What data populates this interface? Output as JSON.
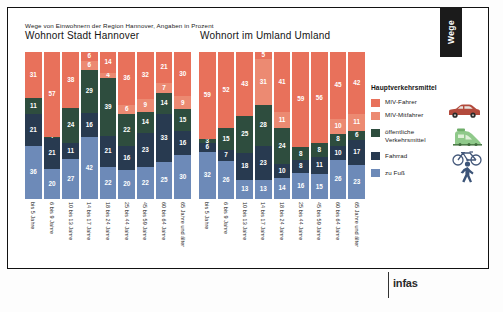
{
  "header": {
    "tab_label": "Wege",
    "subtitle": "Wege von Einwohnern der Region Hannover, Angaben in Prozent"
  },
  "footer": {
    "logo": "infas"
  },
  "legend": {
    "title": "Hauptverkehrsmittel",
    "items": [
      {
        "label": "MIV-Fahrer",
        "color": "#e8715b",
        "icon": "car-icon"
      },
      {
        "label": "MIV-Mitfahrer",
        "color": "#ec8a72",
        "icon": "car-icon"
      },
      {
        "label": "öffentliche Verkehrsmittel",
        "color": "#2e4d3e",
        "icon": "train-icon"
      },
      {
        "label": "Fahrrad",
        "color": "#283a50",
        "icon": "bicycle-icon"
      },
      {
        "label": "zu Fuß",
        "color": "#6d8ab8",
        "icon": "pedestrian-icon"
      }
    ]
  },
  "chart_data": [
    {
      "type": "bar",
      "title": "Wohnort Stadt Hannover",
      "subtitle": "Wege von Einwohnern der Region Hannover, Angaben in Prozent",
      "xlabel": "",
      "ylabel": "Prozent",
      "ylim": [
        0,
        100
      ],
      "stacked": true,
      "grid": false,
      "legend_position": "right",
      "categories": [
        "bis 5 Jahre",
        "6 bis 9 Jahre",
        "10 bis 13 Jahre",
        "14 bis 17 Jahre",
        "18 bis 24 Jahre",
        "25 bis 44 Jahre",
        "45 bis 59 Jahre",
        "60 bis 64 Jahre",
        "65 Jahre und älter"
      ],
      "series": [
        {
          "name": "zu Fuß",
          "color": "#6d8ab8",
          "values": [
            36,
            20,
            27,
            22,
            20,
            22,
            20,
            22,
            25,
            30
          ]
        },
        {
          "name": "Fahrrad",
          "color": "#283a50",
          "values": [
            21,
            21,
            11,
            16,
            21,
            16,
            23,
            33,
            16
          ]
        },
        {
          "name": "öffentliche Verkehrsmittel",
          "color": "#2e4d3e",
          "values": [
            11,
            1,
            24,
            39,
            22,
            6,
            14,
            15,
            15
          ]
        },
        {
          "name": "MIV-Mitfahrer",
          "color": "#ec8a72",
          "values": [
            0,
            0,
            0,
            4,
            6,
            9,
            9,
            7,
            9
          ]
        },
        {
          "name": "MIV-Fahrer",
          "color": "#e8715b",
          "values": [
            31,
            57,
            38,
            14,
            36,
            36,
            32,
            21,
            30
          ]
        }
      ]
    },
    {
      "type": "bar",
      "title": "Wohnort im Umland Umland",
      "subtitle": "Wege von Einwohnern der Region Hannover, Angaben in Prozent",
      "xlabel": "",
      "ylabel": "Prozent",
      "ylim": [
        0,
        100
      ],
      "stacked": true,
      "grid": false,
      "legend_position": "right",
      "categories": [
        "bis 5 Jahre",
        "6 bis 9 Jahre",
        "10 bis 13 Jahre",
        "14 bis 17 Jahre",
        "18 bis 24 Jahre",
        "25 bis 44 Jahre",
        "45 bis 59 Jahre",
        "60 bis 64 Jahre",
        "65 Jahre und älter"
      ],
      "series": [
        {
          "name": "zu Fuß",
          "color": "#6d8ab8",
          "values": [
            32,
            26,
            13,
            13,
            14,
            16,
            16,
            15,
            26,
            23
          ]
        },
        {
          "name": "Fahrrad",
          "color": "#283a50",
          "values": [
            6,
            7,
            18,
            23,
            10,
            8,
            8,
            10,
            10,
            17
          ]
        },
        {
          "name": "öffentliche Verkehrsmittel",
          "color": "#2e4d3e",
          "values": [
            3,
            15,
            25,
            28,
            24,
            8,
            8,
            8,
            8,
            6
          ]
        },
        {
          "name": "MIV-Mitfahrer",
          "color": "#ec8a72",
          "values": [
            0,
            0,
            0,
            5,
            11,
            11,
            0,
            0,
            10,
            11
          ]
        },
        {
          "name": "MIV-Fahrer",
          "color": "#e8715b",
          "values": [
            59,
            52,
            43,
            31,
            41,
            59,
            56,
            45,
            42
          ]
        }
      ]
    }
  ],
  "charts": [
    {
      "id": "left",
      "title": "Wohnort Stadt Hannover",
      "bars": [
        {
          "category": "bis 5 Jahre",
          "segments": [
            {
              "key": "MIV-Fahrer",
              "value": "31"
            },
            {
              "key": "öffentliche Verkehrsmittel",
              "value": "11"
            },
            {
              "key": "Fahrrad",
              "value": "21"
            },
            {
              "key": "zu Fuß",
              "value": "36"
            }
          ]
        },
        {
          "category": "6 bis 9 Jahre",
          "segments": [
            {
              "key": "MIV-Fahrer",
              "value": "57"
            },
            {
              "key": "öffentliche Verkehrsmittel",
              "value": "1"
            },
            {
              "key": "Fahrrad",
              "value": "21"
            },
            {
              "key": "zu Fuß",
              "value": "20"
            }
          ]
        },
        {
          "category": "10 bis 13 Jahre",
          "segments": [
            {
              "key": "MIV-Fahrer",
              "value": "38"
            },
            {
              "key": "öffentliche Verkehrsmittel",
              "value": "24"
            },
            {
              "key": "Fahrrad",
              "value": "11"
            },
            {
              "key": "zu Fuß",
              "value": "27"
            }
          ]
        },
        {
          "category": "14 bis 17 Jahre",
          "segments": [
            {
              "key": "MIV-Fahrer",
              "value": "6"
            },
            {
              "key": "MIV-Mitfahrer",
              "value": "6"
            },
            {
              "key": "öffentliche Verkehrsmittel",
              "value": "29"
            },
            {
              "key": "Fahrrad",
              "value": "16"
            },
            {
              "key": "zu Fuß",
              "value": "42"
            }
          ]
        },
        {
          "category": "18 bis 24 Jahre",
          "segments": [
            {
              "key": "MIV-Fahrer",
              "value": "14"
            },
            {
              "key": "MIV-Mitfahrer",
              "value": "4"
            },
            {
              "key": "öffentliche Verkehrsmittel",
              "value": "39"
            },
            {
              "key": "Fahrrad",
              "value": "21"
            },
            {
              "key": "zu Fuß",
              "value": "22"
            }
          ]
        },
        {
          "category": "25 bis 44 Jahre",
          "segments": [
            {
              "key": "MIV-Fahrer",
              "value": "36"
            },
            {
              "key": "MIV-Mitfahrer",
              "value": "6"
            },
            {
              "key": "öffentliche Verkehrsmittel",
              "value": "22"
            },
            {
              "key": "Fahrrad",
              "value": "16"
            },
            {
              "key": "zu Fuß",
              "value": "20"
            }
          ]
        },
        {
          "category": "45 bis 59 Jahre",
          "segments": [
            {
              "key": "MIV-Fahrer",
              "value": "32"
            },
            {
              "key": "MIV-Mitfahrer",
              "value": "9"
            },
            {
              "key": "öffentliche Verkehrsmittel",
              "value": "14"
            },
            {
              "key": "Fahrrad",
              "value": "23"
            },
            {
              "key": "zu Fuß",
              "value": "22"
            }
          ]
        },
        {
          "category": "60 bis 64 Jahre",
          "segments": [
            {
              "key": "MIV-Fahrer",
              "value": "21"
            },
            {
              "key": "MIV-Mitfahrer",
              "value": "7"
            },
            {
              "key": "öffentliche Verkehrsmittel",
              "value": "14"
            },
            {
              "key": "Fahrrad",
              "value": "33"
            },
            {
              "key": "zu Fuß",
              "value": "25"
            }
          ]
        },
        {
          "category": "65 Jahre und älter",
          "segments": [
            {
              "key": "MIV-Fahrer",
              "value": "30"
            },
            {
              "key": "MIV-Mitfahrer",
              "value": "9"
            },
            {
              "key": "öffentliche Verkehrsmittel",
              "value": "15"
            },
            {
              "key": "Fahrrad",
              "value": "16"
            },
            {
              "key": "zu Fuß",
              "value": "30"
            }
          ]
        }
      ]
    },
    {
      "id": "right",
      "title": "Wohnort im Umland Umland",
      "bars": [
        {
          "category": "bis 5 Jahre",
          "segments": [
            {
              "key": "MIV-Fahrer",
              "value": "59"
            },
            {
              "key": "öffentliche Verkehrsmittel",
              "value": "3"
            },
            {
              "key": "Fahrrad",
              "value": "6"
            },
            {
              "key": "zu Fuß",
              "value": "32"
            }
          ]
        },
        {
          "category": "6 bis 9 Jahre",
          "segments": [
            {
              "key": "MIV-Fahrer",
              "value": "52"
            },
            {
              "key": "öffentliche Verkehrsmittel",
              "value": "15"
            },
            {
              "key": "Fahrrad",
              "value": "7"
            },
            {
              "key": "zu Fuß",
              "value": "26"
            }
          ]
        },
        {
          "category": "10 bis 13 Jahre",
          "segments": [
            {
              "key": "MIV-Fahrer",
              "value": "43"
            },
            {
              "key": "öffentliche Verkehrsmittel",
              "value": "25"
            },
            {
              "key": "Fahrrad",
              "value": "18"
            },
            {
              "key": "zu Fuß",
              "value": "13"
            }
          ]
        },
        {
          "category": "14 bis 17 Jahre",
          "segments": [
            {
              "key": "MIV-Fahrer",
              "value": "5"
            },
            {
              "key": "MIV-Mitfahrer",
              "value": "31"
            },
            {
              "key": "öffentliche Verkehrsmittel",
              "value": "28"
            },
            {
              "key": "Fahrrad",
              "value": "23"
            },
            {
              "key": "zu Fuß",
              "value": "13"
            }
          ]
        },
        {
          "category": "18 bis 24 Jahre",
          "segments": [
            {
              "key": "MIV-Fahrer",
              "value": "41"
            },
            {
              "key": "MIV-Mitfahrer",
              "value": "11"
            },
            {
              "key": "öffentliche Verkehrsmittel",
              "value": "24"
            },
            {
              "key": "Fahrrad",
              "value": "10"
            },
            {
              "key": "zu Fuß",
              "value": "14"
            }
          ]
        },
        {
          "category": "25 bis 44 Jahre",
          "segments": [
            {
              "key": "MIV-Fahrer",
              "value": "59"
            },
            {
              "key": "öffentliche Verkehrsmittel",
              "value": "8"
            },
            {
              "key": "Fahrrad",
              "value": "8"
            },
            {
              "key": "zu Fuß",
              "value": "16"
            }
          ]
        },
        {
          "category": "45 bis 59 Jahre",
          "segments": [
            {
              "key": "MIV-Fahrer",
              "value": "56"
            },
            {
              "key": "öffentliche Verkehrsmittel",
              "value": "8"
            },
            {
              "key": "Fahrrad",
              "value": "11"
            },
            {
              "key": "zu Fuß",
              "value": "15"
            }
          ]
        },
        {
          "category": "60 bis 64 Jahre",
          "segments": [
            {
              "key": "MIV-Fahrer",
              "value": "45"
            },
            {
              "key": "MIV-Mitfahrer",
              "value": "10"
            },
            {
              "key": "öffentliche Verkehrsmittel",
              "value": "8"
            },
            {
              "key": "Fahrrad",
              "value": "10"
            },
            {
              "key": "zu Fuß",
              "value": "26"
            }
          ]
        },
        {
          "category": "65 Jahre und älter",
          "segments": [
            {
              "key": "MIV-Fahrer",
              "value": "42"
            },
            {
              "key": "MIV-Mitfahrer",
              "value": "11"
            },
            {
              "key": "öffentliche Verkehrsmittel",
              "value": "6"
            },
            {
              "key": "Fahrrad",
              "value": "17"
            },
            {
              "key": "zu Fuß",
              "value": "23"
            }
          ]
        }
      ]
    }
  ]
}
